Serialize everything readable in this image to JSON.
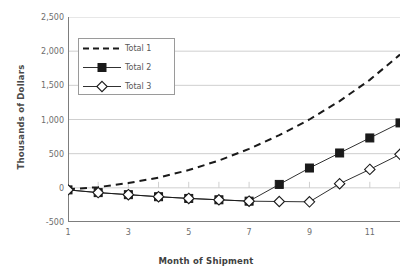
{
  "chart_data": {
    "type": "line",
    "title": "",
    "xlabel": "Month of Shipment",
    "ylabel": "Thousands of Dollars",
    "x": [
      1,
      2,
      3,
      4,
      5,
      6,
      7,
      8,
      9,
      10,
      11,
      12
    ],
    "xlim": [
      1,
      12
    ],
    "ylim": [
      -500,
      2500
    ],
    "ytick_labels": [
      "2,500",
      "2,000",
      "1,500",
      "1,000",
      "500",
      "0",
      "-500"
    ],
    "ytick_values": [
      2500,
      2000,
      1500,
      1000,
      500,
      0,
      -500
    ],
    "xtick_labels": [
      "1",
      "3",
      "5",
      "7",
      "9",
      "11"
    ],
    "xtick_values": [
      1,
      3,
      5,
      7,
      9,
      11
    ],
    "grid": true,
    "legend_position": "upper-left",
    "series": [
      {
        "name": "Total 1",
        "style": "dashed",
        "marker": "none",
        "color": "#1a1a1a",
        "values": [
          -20,
          10,
          70,
          150,
          260,
          400,
          570,
          770,
          1000,
          1270,
          1580,
          1950
        ]
      },
      {
        "name": "Total 2",
        "style": "solid",
        "marker": "filled-square",
        "color": "#1a1a1a",
        "values": [
          -30,
          -70,
          -100,
          -130,
          -155,
          -175,
          -195,
          50,
          290,
          510,
          730,
          950
        ]
      },
      {
        "name": "Total 3",
        "style": "solid",
        "marker": "open-diamond",
        "color": "#1a1a1a",
        "values": [
          -30,
          -70,
          -100,
          -130,
          -155,
          -175,
          -195,
          -200,
          -205,
          60,
          270,
          490
        ]
      }
    ]
  },
  "legend": {
    "items": [
      {
        "label": "Total 1"
      },
      {
        "label": "Total 2"
      },
      {
        "label": "Total 3"
      }
    ]
  },
  "colors": {
    "axis": "#7d7d7d",
    "grid": "#c9c9c9",
    "series": "#1a1a1a",
    "tick_text": "#6d6d6d",
    "title_text": "#4a4a4a",
    "background": "#ffffff"
  }
}
